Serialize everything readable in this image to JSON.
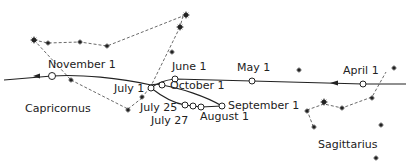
{
  "diagram": {
    "colors": {
      "ink": "#222222",
      "background": "#ffffff"
    },
    "constellations": [
      {
        "name": "Capricornus",
        "label_pos": [
          25,
          103
        ]
      },
      {
        "name": "Sagittarius",
        "label_pos": [
          318,
          142
        ]
      }
    ],
    "date_labels": [
      {
        "text": "November 1",
        "x": 48,
        "y": 59
      },
      {
        "text": "June 1",
        "x": 177,
        "y": 60
      },
      {
        "text": "May 1",
        "x": 237,
        "y": 61
      },
      {
        "text": "April 1",
        "x": 343,
        "y": 64
      },
      {
        "text": "July 1",
        "x": 114,
        "y": 83
      },
      {
        "text": "October 1",
        "x": 174,
        "y": 81
      },
      {
        "text": "September 1",
        "x": 228,
        "y": 104
      },
      {
        "text": "July 25",
        "x": 139,
        "y": 101
      },
      {
        "text": "July 27",
        "x": 151,
        "y": 114
      },
      {
        "text": "August 1",
        "x": 203,
        "y": 114
      }
    ],
    "path_points": [
      {
        "date": "April 1",
        "x": 363,
        "y": 84
      },
      {
        "date": "May 1",
        "x": 252,
        "y": 81
      },
      {
        "date": "June 1",
        "x": 175,
        "y": 80
      },
      {
        "date": "July 1",
        "x": 151,
        "y": 88
      },
      {
        "date": "July 25",
        "x": 185,
        "y": 105
      },
      {
        "date": "July 27",
        "x": 193,
        "y": 106
      },
      {
        "date": "August 1",
        "x": 201,
        "y": 107
      },
      {
        "date": "September 1",
        "x": 222,
        "y": 106
      },
      {
        "date": "October 1",
        "x": 162,
        "y": 85
      },
      {
        "date": "November 1",
        "x": 52,
        "y": 76
      }
    ]
  }
}
